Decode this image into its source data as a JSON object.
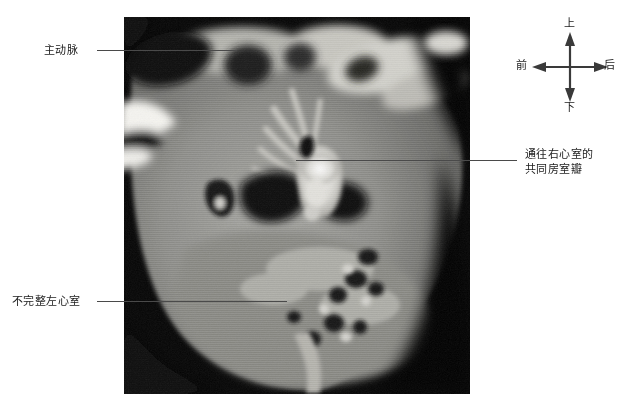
{
  "figure": {
    "type": "anatomical-specimen-photograph",
    "modality": "gross pathology heart specimen, four-chamber view",
    "background_color": "#ffffff",
    "specimen": {
      "frame_color": "#000000",
      "left": 124,
      "top": 17,
      "width": 346,
      "height": 377
    }
  },
  "annotations": [
    {
      "id": "aorta",
      "text": "主动脉",
      "side": "left",
      "leader": {
        "x1": 97,
        "y1": 50,
        "x2": 237,
        "y2": 50
      }
    },
    {
      "id": "incomplete-left-ventricle",
      "text": "不完整左心室",
      "side": "left",
      "leader": {
        "x1": 97,
        "y1": 301,
        "x2": 287,
        "y2": 301
      }
    },
    {
      "id": "common-av-valve-to-right-ventricle",
      "line1": "通往右心室的",
      "line2": "共同房室瓣",
      "side": "right",
      "leader": {
        "x1": 296,
        "y1": 160,
        "x2": 517,
        "y2": 160
      }
    }
  ],
  "compass": {
    "up": "上",
    "down": "下",
    "front": "前",
    "back": "后",
    "arrow_color": "#3a3a3a"
  },
  "colors": {
    "text": "#1c1c1c",
    "leader_line": "#4a4a4a",
    "page_background": "#ffffff",
    "specimen_background": "#000000",
    "tissue_mid": "#8c8c8c",
    "tissue_bright": "#e8e8e6",
    "tissue_dark": "#1a1a1a"
  }
}
